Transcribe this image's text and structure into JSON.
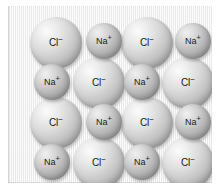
{
  "figure": {
    "name": "sodium-chloride-crystal-lattice",
    "panel_color": "#eeeeee",
    "background_color": "#ffffff",
    "grid": {
      "rows": 4,
      "columns": 4
    }
  },
  "ion_types": {
    "chloride": {
      "symbol": "Cl",
      "charge": "−",
      "label": "Cl⁻",
      "radius_px": 26,
      "color": "#cccccc"
    },
    "sodium": {
      "symbol": "Na",
      "charge": "+",
      "label": "Na⁺",
      "radius_px": 18,
      "color": "#b4b4b4"
    }
  },
  "ions": [
    {
      "id": "r1c1",
      "type": "chloride",
      "symbol": "Cl",
      "charge": "−",
      "row": 1,
      "col": 1,
      "cx": 48,
      "cy": 37,
      "r": 26
    },
    {
      "id": "r1c2",
      "type": "sodium",
      "symbol": "Na",
      "charge": "+",
      "row": 1,
      "col": 2,
      "cx": 96,
      "cy": 35,
      "r": 18
    },
    {
      "id": "r1c3",
      "type": "chloride",
      "symbol": "Cl",
      "charge": "−",
      "row": 1,
      "col": 3,
      "cx": 139,
      "cy": 37,
      "r": 26
    },
    {
      "id": "r1c4",
      "type": "sodium",
      "symbol": "Na",
      "charge": "+",
      "row": 1,
      "col": 4,
      "cx": 185,
      "cy": 35,
      "r": 18
    },
    {
      "id": "r2c1",
      "type": "sodium",
      "symbol": "Na",
      "charge": "+",
      "row": 2,
      "col": 1,
      "cx": 44,
      "cy": 76,
      "r": 18
    },
    {
      "id": "r2c2",
      "type": "chloride",
      "symbol": "Cl",
      "charge": "−",
      "row": 2,
      "col": 2,
      "cx": 91,
      "cy": 77,
      "r": 26
    },
    {
      "id": "r2c3",
      "type": "sodium",
      "symbol": "Na",
      "charge": "+",
      "row": 2,
      "col": 3,
      "cx": 134,
      "cy": 76,
      "r": 18
    },
    {
      "id": "r2c4",
      "type": "chloride",
      "symbol": "Cl",
      "charge": "−",
      "row": 2,
      "col": 4,
      "cx": 180,
      "cy": 77,
      "r": 26
    },
    {
      "id": "r3c1",
      "type": "chloride",
      "symbol": "Cl",
      "charge": "−",
      "row": 3,
      "col": 1,
      "cx": 48,
      "cy": 117,
      "r": 26
    },
    {
      "id": "r3c2",
      "type": "sodium",
      "symbol": "Na",
      "charge": "+",
      "row": 3,
      "col": 2,
      "cx": 96,
      "cy": 116,
      "r": 18
    },
    {
      "id": "r3c3",
      "type": "chloride",
      "symbol": "Cl",
      "charge": "−",
      "row": 3,
      "col": 3,
      "cx": 139,
      "cy": 117,
      "r": 26
    },
    {
      "id": "r3c4",
      "type": "sodium",
      "symbol": "Na",
      "charge": "+",
      "row": 3,
      "col": 4,
      "cx": 185,
      "cy": 116,
      "r": 18
    },
    {
      "id": "r4c1",
      "type": "sodium",
      "symbol": "Na",
      "charge": "+",
      "row": 4,
      "col": 1,
      "cx": 44,
      "cy": 156,
      "r": 18
    },
    {
      "id": "r4c2",
      "type": "chloride",
      "symbol": "Cl",
      "charge": "−",
      "row": 4,
      "col": 2,
      "cx": 91,
      "cy": 157,
      "r": 26
    },
    {
      "id": "r4c3",
      "type": "sodium",
      "symbol": "Na",
      "charge": "+",
      "row": 4,
      "col": 3,
      "cx": 134,
      "cy": 156,
      "r": 18
    },
    {
      "id": "r4c4",
      "type": "chloride",
      "symbol": "Cl",
      "charge": "−",
      "row": 4,
      "col": 4,
      "cx": 180,
      "cy": 157,
      "r": 26
    }
  ]
}
